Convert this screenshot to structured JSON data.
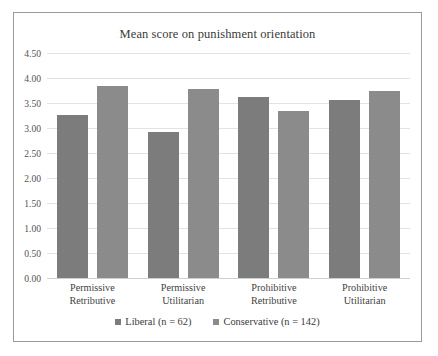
{
  "chart_data": {
    "type": "bar",
    "title": "Mean score on punishment orientation",
    "xlabel": "",
    "ylabel": "",
    "ylim": [
      0.0,
      4.5
    ],
    "ytick_labels": [
      "4.50",
      "4.00",
      "3.50",
      "3.00",
      "2.50",
      "2.00",
      "1.50",
      "1.00",
      "0.50",
      "0.00"
    ],
    "ytick_values": [
      4.5,
      4.0,
      3.5,
      3.0,
      2.5,
      2.0,
      1.5,
      1.0,
      0.5,
      0.0
    ],
    "grid": true,
    "legend_position": "bottom",
    "categories": [
      {
        "line1": "Permissive",
        "line2": "Retributive"
      },
      {
        "line1": "Permissive",
        "line2": "Utilitarian"
      },
      {
        "line1": "Prohibitive",
        "line2": "Retributive"
      },
      {
        "line1": "Prohibitive",
        "line2": "Utilitarian"
      }
    ],
    "series": [
      {
        "name": "Liberal (n = 62)",
        "color": "#7c7c7c",
        "values": [
          3.26,
          2.92,
          3.62,
          3.56
        ]
      },
      {
        "name": "Conservative (n = 142)",
        "color": "#8b8b8b",
        "values": [
          3.84,
          3.78,
          3.34,
          3.74
        ]
      }
    ]
  }
}
